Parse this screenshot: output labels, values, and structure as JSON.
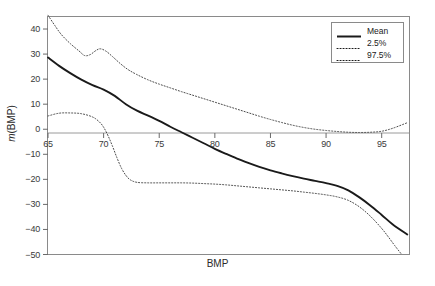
{
  "chart_data": {
    "type": "line",
    "title": "",
    "xlabel": "BMP",
    "ylabel": "m(BMP)",
    "xlim": [
      65,
      97.5
    ],
    "ylim": [
      -50,
      45
    ],
    "xticks": [
      65,
      70,
      75,
      80,
      85,
      90,
      95
    ],
    "yticks": [
      40,
      30,
      20,
      10,
      0,
      -10,
      -20,
      -30,
      -40,
      -50
    ],
    "grid": false,
    "zero_line": true,
    "legend_position": "top-right",
    "legend": [
      "Mean",
      "2.5%",
      "97.5%"
    ],
    "series": [
      {
        "name": "Mean",
        "style": "solid",
        "color": "#1a1a1a",
        "x": [
          65,
          66,
          67,
          68,
          69,
          70,
          71,
          72,
          73,
          74,
          75,
          76,
          77,
          78,
          79,
          80,
          81,
          82,
          83,
          84,
          85,
          86,
          87,
          88,
          89,
          90,
          91,
          92,
          93,
          94,
          95,
          96,
          97.3
        ],
        "y": [
          28.6,
          25.3,
          22.4,
          19.8,
          17.6,
          15.8,
          13.3,
          10.0,
          7.4,
          5.4,
          3.3,
          1.0,
          -1.2,
          -3.4,
          -5.6,
          -7.8,
          -9.8,
          -11.7,
          -13.4,
          -15.0,
          -16.4,
          -17.6,
          -18.7,
          -19.7,
          -20.6,
          -21.5,
          -22.6,
          -24.4,
          -27.2,
          -30.5,
          -34.2,
          -38.0,
          -42.0
        ]
      },
      {
        "name": "2.5%",
        "style": "dotted",
        "color": "#4a4a4a",
        "x": [
          65,
          66,
          67,
          68,
          69,
          69.6,
          70,
          70.4,
          70.8,
          71.2,
          71.6,
          72,
          72.4,
          73,
          74,
          75,
          76,
          77,
          78,
          79,
          80,
          81,
          82,
          83,
          84,
          85,
          86,
          87,
          88,
          89,
          90,
          91,
          92,
          93,
          94,
          95,
          95.6,
          96.2,
          96.8
        ],
        "y": [
          5.3,
          6.4,
          6.5,
          6.2,
          4.9,
          3.0,
          0.8,
          -2.6,
          -6.8,
          -11.4,
          -15.5,
          -18.4,
          -20.2,
          -21.2,
          -21.4,
          -21.4,
          -21.4,
          -21.4,
          -21.5,
          -21.7,
          -21.9,
          -22.2,
          -22.6,
          -23.0,
          -23.4,
          -23.8,
          -24.2,
          -24.6,
          -25.1,
          -25.6,
          -26.2,
          -27.0,
          -28.4,
          -31.0,
          -34.8,
          -39.6,
          -43.0,
          -46.6,
          -50.0
        ]
      },
      {
        "name": "97.5%",
        "style": "dotted",
        "color": "#4a4a4a",
        "x": [
          65,
          65.6,
          66.2,
          67,
          67.8,
          68.3,
          68.8,
          69.3,
          69.7,
          70.2,
          70.8,
          71.5,
          72.2,
          73,
          74,
          75,
          76,
          77,
          78,
          79,
          80,
          81,
          82,
          83,
          84,
          85,
          86,
          87,
          88,
          89,
          90,
          91,
          92,
          93,
          94,
          95,
          96,
          97.3
        ],
        "y": [
          45.5,
          41.5,
          37.8,
          34.2,
          31.2,
          29.4,
          29.8,
          31.4,
          32.1,
          31.2,
          29.0,
          26.2,
          23.8,
          21.8,
          19.7,
          18.0,
          16.5,
          15.0,
          13.6,
          12.2,
          10.8,
          9.4,
          8.0,
          6.6,
          5.2,
          3.9,
          2.7,
          1.6,
          0.7,
          0.0,
          -0.5,
          -0.9,
          -1.2,
          -1.3,
          -1.2,
          -0.8,
          0.4,
          2.6
        ]
      }
    ]
  },
  "axis": {
    "x_tick_labels": [
      "65",
      "70",
      "75",
      "80",
      "85",
      "90",
      "95"
    ],
    "y_tick_labels": [
      "40",
      "30",
      "20",
      "10",
      "0",
      "−10",
      "−20",
      "−30",
      "−40",
      "−50"
    ],
    "xlabel": "BMP",
    "ylabel_italic": "m",
    "ylabel_rest": "(BMP)"
  },
  "legend": {
    "items": [
      {
        "label": "Mean",
        "style": "solid"
      },
      {
        "label": "2.5%",
        "style": "dotted"
      },
      {
        "label": "97.5%",
        "style": "dotted"
      }
    ]
  }
}
